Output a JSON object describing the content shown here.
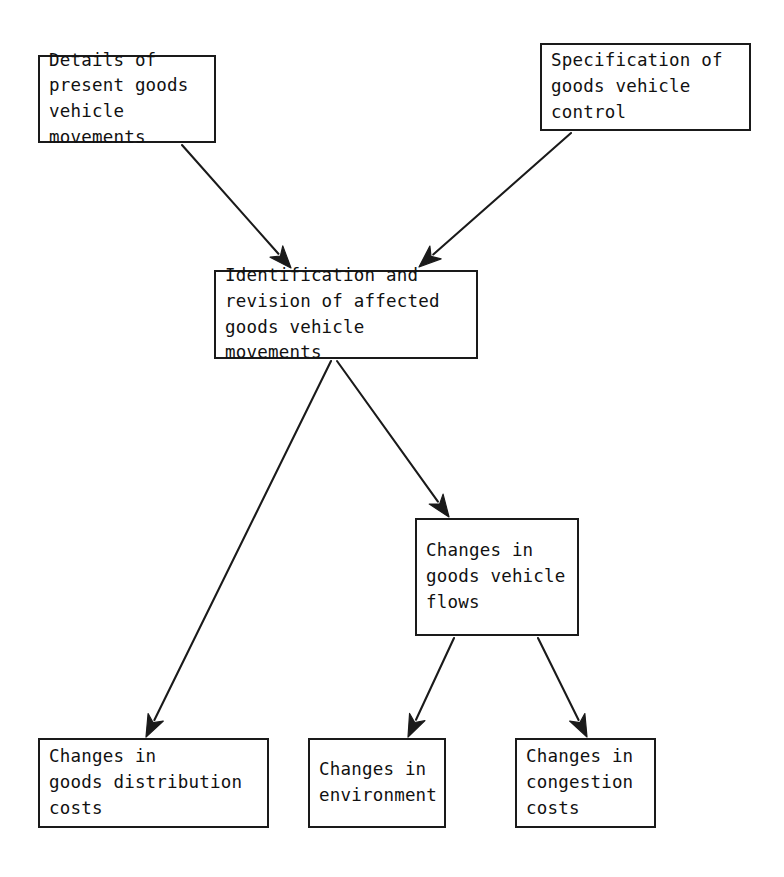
{
  "diagram": {
    "type": "flowchart",
    "background_color": "#ffffff",
    "line_color": "#1a1a1a",
    "text_color": "#111111",
    "nodes": [
      {
        "id": "details-present-movements",
        "label": "Details of\npresent goods\nvehicle\nmovements",
        "x": 38,
        "y": 55,
        "w": 178,
        "h": 88
      },
      {
        "id": "specification-control",
        "label": "Specification of\ngoods vehicle\ncontrol",
        "x": 540,
        "y": 43,
        "w": 211,
        "h": 88
      },
      {
        "id": "identification-revision",
        "label": "Identification and\nrevision of affected\ngoods vehicle\nmovements",
        "x": 214,
        "y": 270,
        "w": 264,
        "h": 89
      },
      {
        "id": "changes-goods-vehicle-flows",
        "label": "Changes in\ngoods vehicle\nflows",
        "x": 415,
        "y": 518,
        "w": 164,
        "h": 118
      },
      {
        "id": "changes-distribution-costs",
        "label": "Changes in\ngoods distribution\ncosts",
        "x": 38,
        "y": 738,
        "w": 231,
        "h": 90
      },
      {
        "id": "changes-environment",
        "label": "Changes in\nenvironment",
        "x": 308,
        "y": 738,
        "w": 138,
        "h": 90
      },
      {
        "id": "changes-congestion-costs",
        "label": "Changes in\ncongestion\ncosts",
        "x": 515,
        "y": 738,
        "w": 141,
        "h": 90
      }
    ],
    "edges": [
      {
        "id": "edge-details-to-identification",
        "from": "details-present-movements",
        "to": "identification-revision",
        "x1": 182,
        "y1": 145,
        "x2": 291,
        "y2": 268
      },
      {
        "id": "edge-specification-to-identification",
        "from": "specification-control",
        "to": "identification-revision",
        "x1": 571,
        "y1": 133,
        "x2": 419,
        "y2": 267
      },
      {
        "id": "edge-identification-to-distribution",
        "from": "identification-revision",
        "to": "changes-distribution-costs",
        "x1": 331,
        "y1": 361,
        "x2": 146,
        "y2": 737
      },
      {
        "id": "edge-identification-to-flows",
        "from": "identification-revision",
        "to": "changes-goods-vehicle-flows",
        "x1": 337,
        "y1": 361,
        "x2": 449,
        "y2": 517
      },
      {
        "id": "edge-flows-to-environment",
        "from": "changes-goods-vehicle-flows",
        "to": "changes-environment",
        "x1": 454,
        "y1": 638,
        "x2": 408,
        "y2": 737
      },
      {
        "id": "edge-flows-to-congestion",
        "from": "changes-goods-vehicle-flows",
        "to": "changes-congestion-costs",
        "x1": 538,
        "y1": 638,
        "x2": 587,
        "y2": 737
      }
    ]
  }
}
